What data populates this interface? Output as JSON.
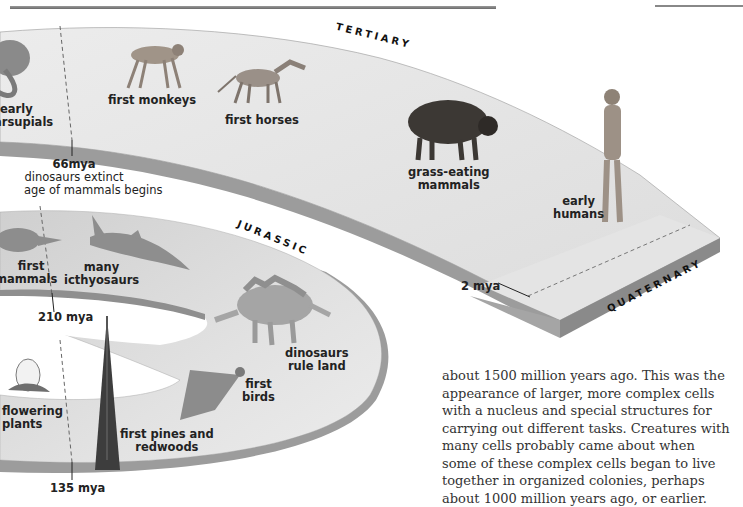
{
  "header": {
    "page_marker": "BY 2 5.5"
  },
  "eras": {
    "tertiary": "TERTIARY",
    "jurassic": "JURASSIC",
    "quaternary": "QUATERNARY"
  },
  "markers": {
    "m66": {
      "title": "66mya",
      "line1": "dinosaurs extinct",
      "line2": "age of mammals begins"
    },
    "m2": "2 mya",
    "m210": "210 mya",
    "m135": "135 mya"
  },
  "events": {
    "early_marsupials": {
      "line1": "early",
      "line2": "marsupials",
      "icon": "marsupial-icon"
    },
    "first_monkeys": {
      "line1": "first monkeys",
      "icon": "monkey-icon"
    },
    "first_horses": {
      "line1": "first horses",
      "icon": "horse-icon"
    },
    "grass_eating_mammals": {
      "line1": "grass-eating",
      "line2": "mammals",
      "icon": "bison-icon"
    },
    "early_humans": {
      "line1": "early",
      "line2": "humans",
      "icon": "human-icon"
    },
    "first_mammals": {
      "line1": "first",
      "line2": "mammals",
      "icon": "shrew-icon"
    },
    "many_icthyosaurs": {
      "line1": "many",
      "line2": "icthyosaurs",
      "icon": "icthyosaur-icon"
    },
    "dinosaurs_rule_land": {
      "line1": "dinosaurs",
      "line2": "rule land",
      "icon": "stegosaurus-icon"
    },
    "first_birds": {
      "line1": "first",
      "line2": "birds",
      "icon": "bird-icon"
    },
    "flowering_plants": {
      "line1": "flowering",
      "line2": "plants",
      "icon": "flower-icon"
    },
    "first_pines": {
      "line1": "first pines and",
      "line2": "redwoods",
      "icon": "pine-tree-icon"
    }
  },
  "body_text": {
    "lines": [
      "about 1500 million years ago. This was the",
      "appearance of larger, more complex cells",
      "with a nucleus and special structures for",
      "carrying out different tasks. Creatures with",
      "many cells probably came about when",
      "some of these complex cells began to live",
      "together in organized colonies, perhaps",
      "about 1000 million years ago, or earlier."
    ]
  },
  "colors": {
    "band_top": "#e6e6e6",
    "band_side": "#9c9c9c",
    "band_side_dark": "#7d7d7d",
    "text": "#222222"
  }
}
